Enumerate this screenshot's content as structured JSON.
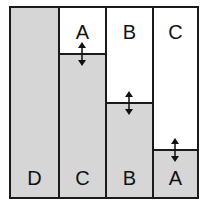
{
  "diagram": {
    "fill_color": "#d6d6d6",
    "line_color": "#1a1a1a",
    "columns": [
      {
        "bottom_label": "D",
        "top_label": "",
        "split_y": null
      },
      {
        "bottom_label": "C",
        "top_label": "A",
        "split_y": 47
      },
      {
        "bottom_label": "B",
        "top_label": "B",
        "split_y": 96
      },
      {
        "bottom_label": "A",
        "top_label": "C",
        "split_y": 143
      }
    ],
    "arrow_icon": "double-vertical-arrow"
  }
}
